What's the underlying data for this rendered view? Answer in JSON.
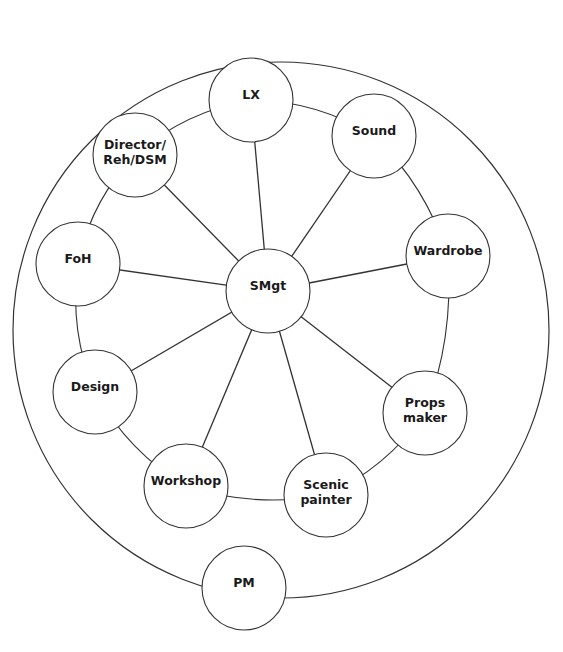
{
  "diagram": {
    "title": "",
    "outer_circle": {
      "cx": 281,
      "cy": 330,
      "r": 268
    },
    "ring": {
      "cx": 268,
      "cy": 300,
      "r": 205
    },
    "center_node": {
      "id": "smgt",
      "label_lines": [
        "SMgt"
      ],
      "cx": 268,
      "cy": 291,
      "r": 42
    },
    "nodes": [
      {
        "id": "lx",
        "label_lines": [
          "LX"
        ],
        "cx": 251,
        "cy": 100,
        "r": 42,
        "spoke": true
      },
      {
        "id": "sound",
        "label_lines": [
          "Sound"
        ],
        "cx": 374,
        "cy": 136,
        "r": 42,
        "spoke": true
      },
      {
        "id": "wardrobe",
        "label_lines": [
          "Wardrobe"
        ],
        "cx": 448,
        "cy": 256,
        "r": 42,
        "spoke": true
      },
      {
        "id": "props-maker",
        "label_lines": [
          "Props",
          "maker"
        ],
        "cx": 425,
        "cy": 413,
        "r": 42,
        "spoke": true
      },
      {
        "id": "scenic-painter",
        "label_lines": [
          "Scenic",
          "painter"
        ],
        "cx": 326,
        "cy": 495,
        "r": 42,
        "spoke": true
      },
      {
        "id": "workshop",
        "label_lines": [
          "Workshop"
        ],
        "cx": 186,
        "cy": 486,
        "r": 42,
        "spoke": true
      },
      {
        "id": "design",
        "label_lines": [
          "Design"
        ],
        "cx": 95,
        "cy": 392,
        "r": 42,
        "spoke": true
      },
      {
        "id": "foh",
        "label_lines": [
          "FoH"
        ],
        "cx": 78,
        "cy": 264,
        "r": 42,
        "spoke": true
      },
      {
        "id": "director",
        "label_lines": [
          "Director/",
          "Reh/DSM"
        ],
        "cx": 135,
        "cy": 155,
        "r": 42,
        "spoke": true
      }
    ],
    "outer_node": {
      "id": "pm",
      "label_lines": [
        "PM"
      ],
      "cx": 244,
      "cy": 588,
      "r": 42
    },
    "stroke_color": "#333333",
    "fill_color": "#ffffff",
    "text_color": "#1a1a1a"
  }
}
